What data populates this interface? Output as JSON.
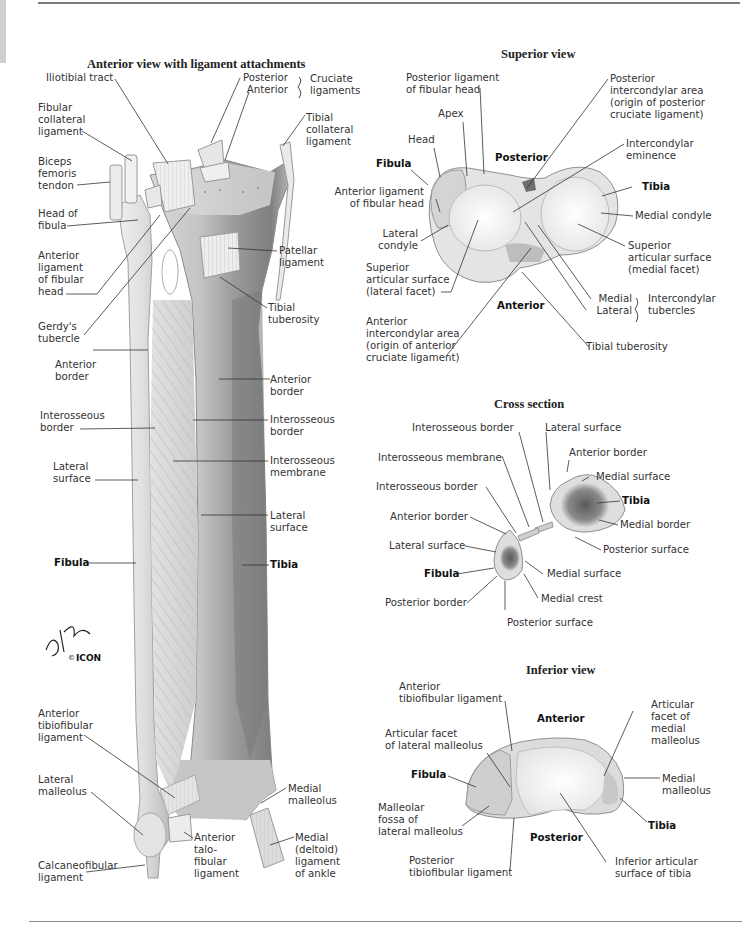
{
  "plate": {
    "colors": {
      "bone_light": "#eeeeee",
      "bone_mid": "#cfcfcf",
      "bone_dark": "#8c8c8c",
      "marrow": "#6b6b6b",
      "leader_line": "#333333",
      "rule": "#7a7a7a"
    }
  },
  "anterior_view": {
    "title": "Anterior view with ligament attachments",
    "labels": {
      "iliotibial_tract": "Iliotibial tract",
      "posterior": "Posterior",
      "anterior": "Anterior",
      "cruciate_ligaments": "Cruciate\nligaments",
      "fibular_collateral": "Fibular\ncollateral\nligament",
      "tibial_collateral": "Tibial\ncollateral\nligament",
      "biceps_femoris": "Biceps\nfemoris\ntendon",
      "head_of_fibula": "Head of\nfibula",
      "anterior_lig_fibular_head": "Anterior\nligament\nof fibular\nhead",
      "patellar_ligament": "Patellar\nligament",
      "tibial_tuberosity": "Tibial\ntuberosity",
      "gerdys_tubercle": "Gerdy's\ntubercle",
      "anterior_border_fib": "Anterior\nborder",
      "anterior_border_tib": "Anterior\nborder",
      "interosseous_border_fib": "Interosseous\nborder",
      "interosseous_border_tib": "Interosseous\nborder",
      "lateral_surface_fib": "Lateral\nsurface",
      "interosseous_membrane": "Interosseous\nmembrane",
      "lateral_surface_tib": "Lateral\nsurface",
      "fibula": "Fibula",
      "tibia": "Tibia",
      "anterior_tibiofibular": "Anterior\ntibiofibular\nligament",
      "lateral_malleolus": "Lateral\nmalleolus",
      "medial_malleolus": "Medial\nmalleolus",
      "anterior_talofibular": "Anterior\ntalo-\nfibular\nligament",
      "medial_deltoid": "Medial\n(deltoid)\nligament\nof ankle",
      "calcaneofibular": "Calcaneofibular\nligament"
    },
    "signature": {
      "artist": "F. Netter M.D.",
      "copyright": "©",
      "publisher": "ICON"
    }
  },
  "superior_view": {
    "title": "Superior view",
    "labels": {
      "posterior_lig_fibular_head": "Posterior ligament\nof fibular head",
      "apex": "Apex",
      "head": "Head",
      "fibula": "Fibula",
      "posterior": "Posterior",
      "posterior_intercondylar": "Posterior\nintercondylar area\n(origin of posterior\ncruciate ligament)",
      "intercondylar_eminence": "Intercondylar\neminence",
      "tibia": "Tibia",
      "anterior_lig_fibular_head": "Anterior ligament\nof fibular head",
      "medial_condyle": "Medial condyle",
      "lateral_condyle": "Lateral\ncondyle",
      "superior_articular_medial": "Superior\narticular surface\n(medial facet)",
      "superior_articular_lateral": "Superior\narticular surface\n(lateral facet)",
      "anterior": "Anterior",
      "medial": "Medial",
      "lateral": "Lateral",
      "intercondylar_tubercles": "Intercondylar\ntubercles",
      "anterior_intercondylar": "Anterior\nintercondylar area\n(origin of anterior\ncruciate ligament)",
      "tibial_tuberosity": "Tibial tuberosity"
    }
  },
  "cross_section": {
    "title": "Cross section",
    "labels": {
      "interosseous_border_top": "Interosseous border",
      "lateral_surface_tib": "Lateral surface",
      "anterior_border_tib": "Anterior border",
      "interosseous_membrane": "Interosseous membrane",
      "medial_surface_tib": "Medial surface",
      "interosseous_border_fib": "Interosseous border",
      "tibia": "Tibia",
      "anterior_border_fib": "Anterior border",
      "medial_border": "Medial border",
      "lateral_surface_fib": "Lateral surface",
      "posterior_surface_tib": "Posterior surface",
      "fibula": "Fibula",
      "medial_surface_fib": "Medial surface",
      "posterior_border": "Posterior border",
      "medial_crest": "Medial crest",
      "posterior_surface_fib": "Posterior surface"
    }
  },
  "inferior_view": {
    "title": "Inferior view",
    "labels": {
      "anterior_tibiofibular": "Anterior\ntibiofibular ligament",
      "anterior": "Anterior",
      "articular_facet_medial": "Articular\nfacet of\nmedial\nmalleolus",
      "articular_facet_lateral": "Articular facet\nof lateral malleolus",
      "fibula": "Fibula",
      "medial_malleolus": "Medial\nmalleolus",
      "malleolar_fossa": "Malleolar\nfossa of\nlateral malleolus",
      "tibia": "Tibia",
      "posterior": "Posterior",
      "posterior_tibiofibular": "Posterior\ntibiofibular ligament",
      "inferior_articular": "Inferior articular\nsurface of tibia"
    }
  }
}
